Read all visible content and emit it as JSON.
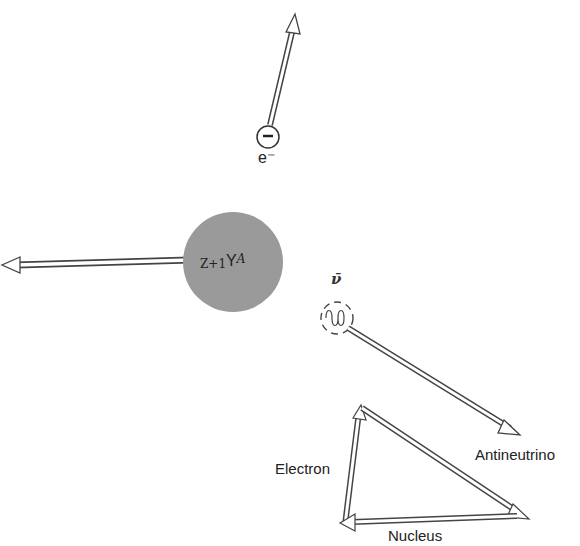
{
  "diagram": {
    "electron": {
      "symbol": "e⁻",
      "charge_sign": "−"
    },
    "nucleus": {
      "prefix": "Z+1",
      "symbol": "Y",
      "superscript": "A",
      "fill_color": "#9a9a9a"
    },
    "antineutrino": {
      "symbol": "ν̄"
    },
    "labels": {
      "antineutrino": "Antineutrino",
      "electron": "Electron",
      "nucleus": "Nucleus"
    }
  }
}
